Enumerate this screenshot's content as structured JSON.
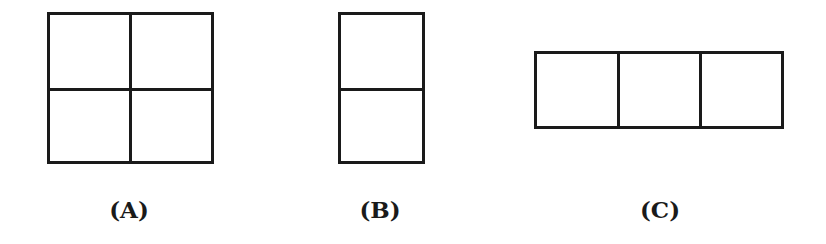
{
  "figures": [
    {
      "id": "A",
      "label": "(A)",
      "grid": {
        "rows": 2,
        "cols": 2
      }
    },
    {
      "id": "B",
      "label": "(B)",
      "grid": {
        "rows": 2,
        "cols": 1
      }
    },
    {
      "id": "C",
      "label": "(C)",
      "grid": {
        "rows": 1,
        "cols": 3
      }
    }
  ],
  "colors": {
    "stroke": "#1a1a1a",
    "background": "#ffffff"
  }
}
